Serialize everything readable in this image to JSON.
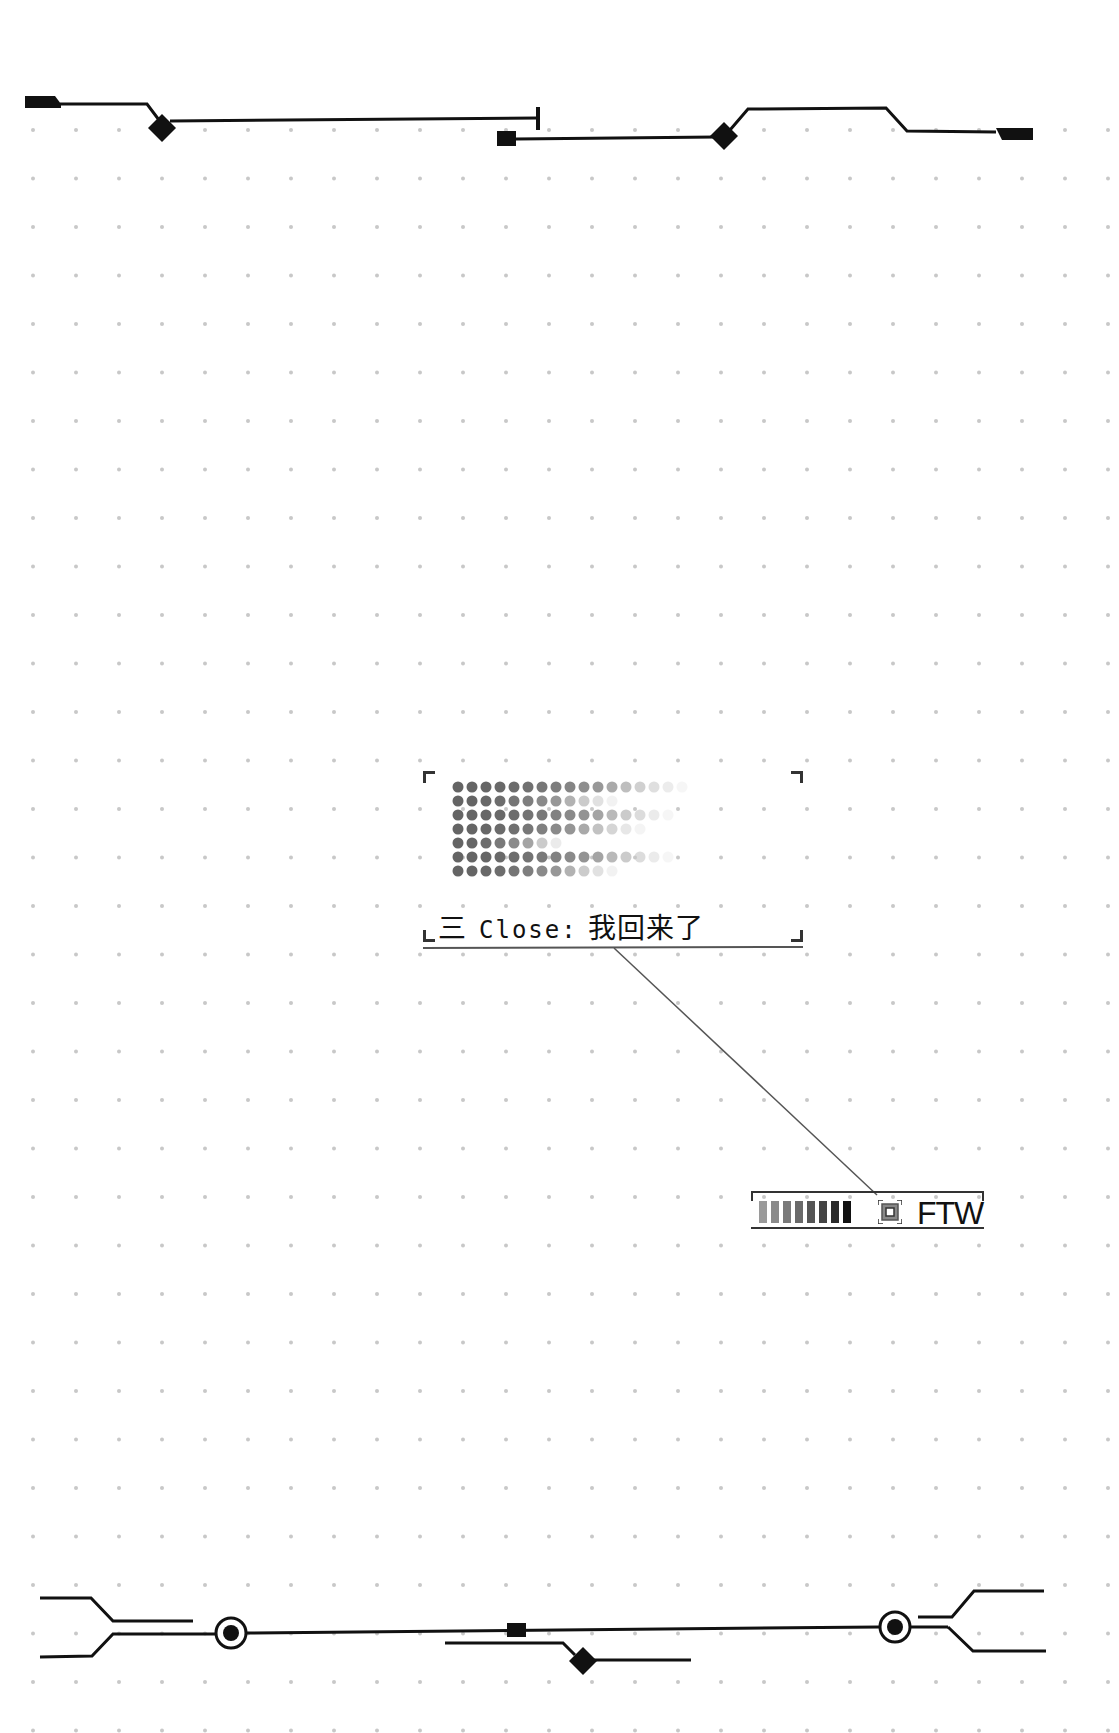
{
  "window": {
    "background": "#ffffff",
    "grid_dot_color": "#c8c8c8"
  },
  "panel": {
    "menu_icon": "hamburger-icon",
    "menu_glyph": "三",
    "label_prefix": "Close:",
    "label_value": "我回来了",
    "dot_matrix_rows": [
      17,
      12,
      16,
      14,
      8,
      16,
      12
    ]
  },
  "badge": {
    "label": "FTW",
    "bar_count": 8,
    "bar_colors": [
      "#9a9a9a",
      "#8a8a8a",
      "#7a7a7a",
      "#6a6a6a",
      "#555555",
      "#444444",
      "#2a2a2a",
      "#111111"
    ],
    "icon": "target-square-icon"
  },
  "decor": {
    "line_color": "#111111"
  }
}
